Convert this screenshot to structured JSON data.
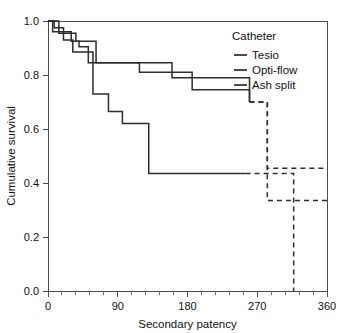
{
  "chart_data": {
    "type": "line",
    "title": "",
    "xlabel": "Secondary patency",
    "ylabel": "Cumulative survival",
    "xlim": [
      0,
      360
    ],
    "ylim": [
      0.0,
      1.0
    ],
    "grid": false,
    "legend_position": "top-right",
    "legend_title": "Catheter",
    "x_ticks": [
      0,
      90,
      180,
      270,
      360
    ],
    "x_tick_labels": [
      "0",
      "90",
      "180",
      "270",
      "360"
    ],
    "x_minor_tick_interval": 18,
    "y_ticks": [
      0.0,
      0.2,
      0.4,
      0.6,
      0.8,
      1.0
    ],
    "y_tick_labels": [
      "0.0",
      "0.2",
      "0.4",
      "0.6",
      "0.8",
      "1.0"
    ],
    "series": [
      {
        "name": "Tesio",
        "style": "solid",
        "color": "#2e2e2e",
        "step": "post",
        "x": [
          0,
          10,
          14,
          24,
          36,
          44,
          62,
          105,
          160,
          248,
          260
        ],
        "y": [
          1.0,
          1.0,
          0.955,
          0.955,
          0.925,
          0.925,
          0.845,
          0.845,
          0.79,
          0.79,
          0.7
        ],
        "dashed_continuation": {
          "x": [
            260,
            283,
            283,
            360
          ],
          "y": [
            0.7,
            0.7,
            0.455,
            0.455
          ]
        }
      },
      {
        "name": "Opti-flow",
        "style": "solid",
        "color": "#2e2e2e",
        "step": "post",
        "x": [
          0,
          6,
          18,
          30,
          40,
          52,
          74,
          118,
          142,
          186,
          240,
          260
        ],
        "y": [
          1.0,
          0.96,
          0.96,
          0.925,
          0.905,
          0.845,
          0.845,
          0.81,
          0.81,
          0.745,
          0.745,
          0.7
        ],
        "dashed_continuation": {
          "x": [
            260,
            283,
            283,
            360
          ],
          "y": [
            0.7,
            0.7,
            0.335,
            0.335
          ]
        }
      },
      {
        "name": "Ash split",
        "style": "solid",
        "color": "#2e2e2e",
        "step": "post",
        "x": [
          0,
          8,
          20,
          32,
          48,
          58,
          78,
          96,
          118,
          130,
          255
        ],
        "y": [
          1.0,
          0.975,
          0.93,
          0.885,
          0.885,
          0.73,
          0.665,
          0.62,
          0.62,
          0.435,
          0.435
        ],
        "dashed_continuation": {
          "x": [
            255,
            317,
            317
          ],
          "y": [
            0.435,
            0.435,
            0.0
          ]
        }
      }
    ],
    "annotations": [
      {
        "label": "censoring-drop-line",
        "type": "vertical-dashed",
        "x": 317,
        "y_from": 0.435,
        "y_to": 0.0
      }
    ]
  },
  "legend": {
    "title": "Catheter",
    "entries": [
      {
        "label": "Tesio"
      },
      {
        "label": "Opti-flow"
      },
      {
        "label": "Ash split"
      }
    ]
  },
  "axes": {
    "y_title": "Cumulative survival",
    "x_title": "Secondary patency",
    "y_labels": [
      "1.0",
      "0.8",
      "0.6",
      "0.4",
      "0.2",
      "0.0"
    ],
    "x_labels": [
      "0",
      "90",
      "180",
      "270",
      "360"
    ]
  }
}
